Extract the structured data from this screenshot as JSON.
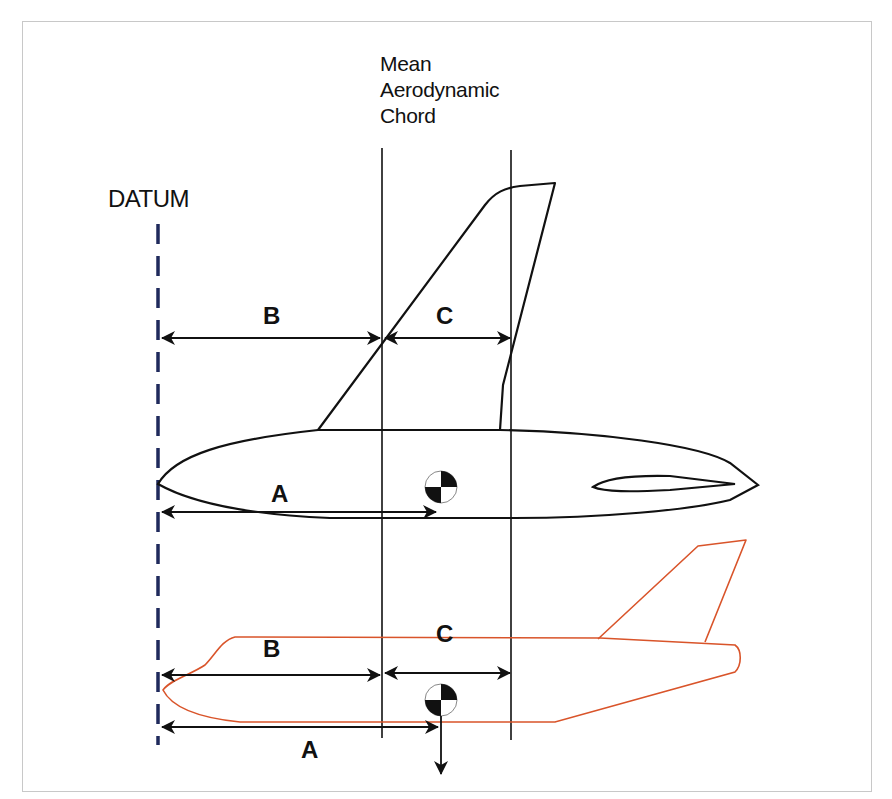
{
  "diagram": {
    "title_lines": [
      "Mean",
      "Aerodynamic",
      "Chord"
    ],
    "datum_label": "DATUM",
    "colors": {
      "outline": "#111111",
      "datum_line": "#1f2a5c",
      "airliner_outline": "#d9542a",
      "frame_border": "#c8c8c8",
      "background": "#ffffff"
    },
    "top_view": {
      "description": "Swept-wing planform over fuselage top view",
      "dimensions": [
        {
          "label": "B",
          "meaning": "Datum to MAC leading edge"
        },
        {
          "label": "C",
          "meaning": "MAC length"
        },
        {
          "label": "A",
          "meaning": "Datum to center of gravity"
        }
      ],
      "cg_symbol": "center-of-gravity"
    },
    "side_view": {
      "description": "Airliner side profile (orange outline)",
      "dimensions": [
        {
          "label": "B",
          "meaning": "Datum to MAC leading edge"
        },
        {
          "label": "C",
          "meaning": "MAC length"
        },
        {
          "label": "A",
          "meaning": "Datum to center of gravity"
        }
      ],
      "cg_symbol": "center-of-gravity",
      "weight_arrow": "down"
    }
  }
}
